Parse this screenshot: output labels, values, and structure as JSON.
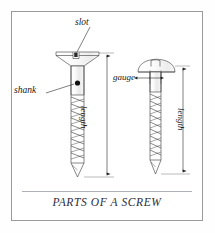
{
  "figure": {
    "caption": "PARTS OF A SCREW",
    "border_color": "#9a9a9a",
    "background_color": "#ffffff",
    "line_color": "#3a3a3a",
    "width": 215,
    "height": 233
  },
  "labels": {
    "slot": "slot",
    "shank": "shank",
    "gauge": "gauge",
    "length_left": "length",
    "length_right": "length"
  },
  "diagram": {
    "type": "technical-illustration",
    "items": [
      {
        "name": "countersunk-flat-head-screw",
        "head_style": "flat countersunk",
        "has_slot": true,
        "annotations": [
          "slot",
          "shank",
          "length"
        ],
        "thread_turns": 9
      },
      {
        "name": "round-head-screw",
        "head_style": "round dome",
        "has_slot": true,
        "annotations": [
          "gauge",
          "length"
        ],
        "thread_turns": 9
      }
    ],
    "dimension_lines": [
      {
        "name": "length-left",
        "orientation": "vertical",
        "label": "length",
        "arrowheads": "both"
      },
      {
        "name": "length-right",
        "orientation": "vertical",
        "label": "length",
        "arrowheads": "both"
      },
      {
        "name": "gauge",
        "orientation": "horizontal",
        "label": "gauge",
        "arrowheads": "both"
      }
    ],
    "leader_lines": [
      {
        "name": "slot-leader",
        "label": "slot"
      },
      {
        "name": "shank-leader",
        "label": "shank"
      }
    ]
  }
}
